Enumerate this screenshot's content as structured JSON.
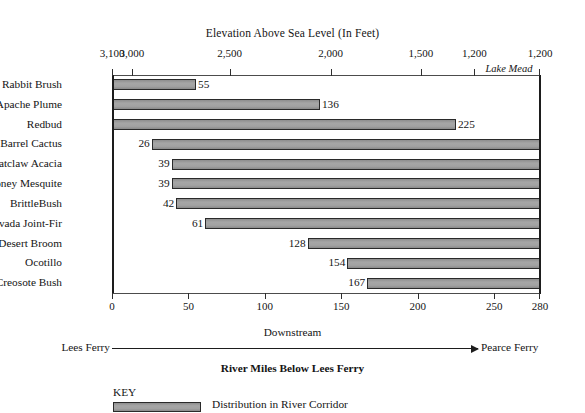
{
  "chart_data": {
    "type": "bar",
    "title": "Elevation Above Sea Level (In Feet)",
    "xlabel": "River Miles Below Lees Ferry",
    "ylabel": "",
    "orientation": "horizontal",
    "grid": false,
    "legend_position": "bottom-left",
    "categories": [
      "Rabbit Brush",
      "Apache Plume",
      "Redbud",
      "Barrel Cactus",
      "Catclaw Acacia",
      "Honey Mesquite",
      "BrittleBush",
      "Nevada Joint-Fir",
      "Desert Broom",
      "Ocotillo",
      "Creosote Bush"
    ],
    "values": [
      55,
      136,
      225,
      26,
      39,
      39,
      42,
      61,
      128,
      154,
      167
    ],
    "bars": [
      {
        "category": "Rabbit Brush",
        "start": 0,
        "end": 55,
        "label": "55",
        "label_side": "right"
      },
      {
        "category": "Apache Plume",
        "start": 0,
        "end": 136,
        "label": "136",
        "label_side": "right"
      },
      {
        "category": "Redbud",
        "start": 0,
        "end": 225,
        "label": "225",
        "label_side": "right"
      },
      {
        "category": "Barrel Cactus",
        "start": 26,
        "end": 280,
        "label": "26",
        "label_side": "left"
      },
      {
        "category": "Catclaw Acacia",
        "start": 39,
        "end": 280,
        "label": "39",
        "label_side": "left"
      },
      {
        "category": "Honey Mesquite",
        "start": 39,
        "end": 280,
        "label": "39",
        "label_side": "left"
      },
      {
        "category": "BrittleBush",
        "start": 42,
        "end": 280,
        "label": "42",
        "label_side": "left"
      },
      {
        "category": "Nevada Joint-Fir",
        "start": 61,
        "end": 280,
        "label": "61",
        "label_side": "left"
      },
      {
        "category": "Desert Broom",
        "start": 128,
        "end": 280,
        "label": "128",
        "label_side": "left"
      },
      {
        "category": "Ocotillo",
        "start": 154,
        "end": 280,
        "label": "154",
        "label_side": "left"
      },
      {
        "category": "Creosote Bush",
        "start": 167,
        "end": 280,
        "label": "167",
        "label_side": "left"
      }
    ],
    "xlim": [
      0,
      280
    ],
    "x_ticks": [
      {
        "value": 0,
        "label": "0"
      },
      {
        "value": 50,
        "label": "50"
      },
      {
        "value": 100,
        "label": "100"
      },
      {
        "value": 150,
        "label": "150"
      },
      {
        "value": 200,
        "label": "200"
      },
      {
        "value": 250,
        "label": "250"
      },
      {
        "value": 280,
        "label": "280"
      }
    ],
    "top_axis": {
      "label": "Elevation Above Sea Level (In Feet)",
      "ticks": [
        {
          "mile": 0,
          "label": "3,100"
        },
        {
          "mile": 13,
          "label": "3,000"
        },
        {
          "mile": 77,
          "label": "2,500"
        },
        {
          "mile": 143,
          "label": "2,000"
        },
        {
          "mile": 202,
          "label": "1,500"
        },
        {
          "mile": 237,
          "label": "1,200"
        },
        {
          "mile": 280,
          "label": "1,200"
        }
      ],
      "annotation": "Lake Mead"
    },
    "bar_color": "#9b9b9b",
    "bar_border_color": "#2a2a2a"
  },
  "footer": {
    "downstream_label": "Downstream",
    "left_endpoint": "Lees Ferry",
    "right_endpoint": "Pearce Ferry",
    "axis_caption": "River Miles Below Lees Ferry"
  },
  "key": {
    "heading": "KEY",
    "entry_label": "Distribution in River Corridor"
  }
}
